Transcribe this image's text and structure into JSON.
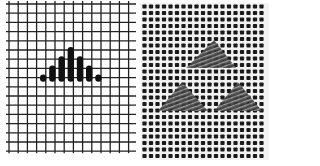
{
  "figure": {
    "left_panel": {
      "label": "Stitch chart diagram",
      "grid": {
        "x0": 9,
        "y0": 4,
        "cols": 14,
        "rows": 16,
        "pitch": 9.2,
        "line_color": "#222222"
      },
      "stitches": [
        {
          "col": 3,
          "top_row": 8,
          "bottom_row": 8
        },
        {
          "col": 4,
          "top_row": 7,
          "bottom_row": 8
        },
        {
          "col": 5,
          "top_row": 6,
          "bottom_row": 8
        },
        {
          "col": 6,
          "top_row": 5,
          "bottom_row": 8
        },
        {
          "col": 7,
          "top_row": 6,
          "bottom_row": 8
        },
        {
          "col": 8,
          "top_row": 7,
          "bottom_row": 8
        },
        {
          "col": 9,
          "top_row": 8,
          "bottom_row": 8
        }
      ],
      "stitch_color": "#111111",
      "caption": "· ·  · ·"
    },
    "right_panel": {
      "label": "Worked stitches on needlepoint canvas photo",
      "canvas": {
        "x0": 5,
        "y0": 3,
        "width": 128,
        "height": 157,
        "pitch": 6.5,
        "thread_color": "#f2f2f2",
        "hole_color": "#1a1a1a"
      },
      "motifs": [
        {
          "name": "top-triangle",
          "apex": [
            78,
            40
          ],
          "base_left": [
            50,
            68
          ],
          "base_right": [
            100,
            68
          ]
        },
        {
          "name": "bottom-left-triangle",
          "apex": [
            46,
            82
          ],
          "base_left": [
            22,
            111
          ],
          "base_right": [
            72,
            111
          ]
        },
        {
          "name": "bottom-right-triangle",
          "apex": [
            102,
            82
          ],
          "base_left": [
            78,
            111
          ],
          "base_right": [
            126,
            111
          ]
        }
      ],
      "motif_color": "#3a3a3a"
    }
  }
}
